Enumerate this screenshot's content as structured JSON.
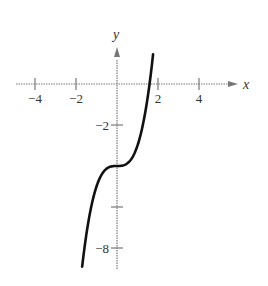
{
  "chart_data": {
    "type": "line",
    "title": "",
    "xlabel": "x",
    "ylabel": "y",
    "xlim": [
      -4.5,
      5.6
    ],
    "ylim": [
      -9.2,
      3.0
    ],
    "x_ticks": [
      -4,
      -2,
      2,
      4
    ],
    "x_tick_labels": [
      "−4",
      "−2",
      "2",
      "4"
    ],
    "y_ticks": [
      -2,
      -6,
      -8
    ],
    "y_tick_labels": [
      "−2",
      "",
      "−8"
    ],
    "grid": false,
    "legend": null,
    "series": [
      {
        "name": "y = x^3 - 4",
        "x": [
          -1.7,
          -1.5,
          -1.25,
          -1.0,
          -0.75,
          -0.5,
          -0.25,
          0,
          0.25,
          0.5,
          0.75,
          1.0,
          1.25,
          1.5,
          1.6,
          1.76
        ],
        "values": [
          -8.91,
          -7.38,
          -5.95,
          -5.0,
          -4.42,
          -4.13,
          -4.02,
          -4.0,
          -3.98,
          -3.88,
          -3.58,
          -3.0,
          -2.05,
          -0.63,
          0.1,
          1.45
        ]
      }
    ]
  },
  "axes": {
    "x_label": "x",
    "y_label": "y",
    "x_tick_labels": [
      "−4",
      "−2",
      "2",
      "4"
    ],
    "y_tick_labels": [
      "−2",
      "−8"
    ]
  }
}
